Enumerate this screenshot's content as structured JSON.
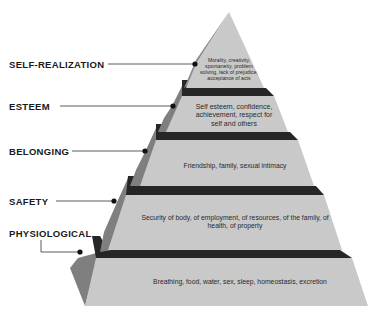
{
  "diagram": {
    "type": "pyramid",
    "title": "",
    "colors": {
      "front_face": "#c9c9c9",
      "side_face": "#7f7f7f",
      "dark_band": "#262626",
      "connector": "#333333",
      "background": "#ffffff"
    },
    "levels": [
      {
        "label": "SELF-REALIZATION",
        "description": "Morality, creativity, spontaneity, problem solving, lack of prejudice, acceptance of acts"
      },
      {
        "label": "ESTEEM",
        "description": "Self esteem, confidence, achievement, respect for self and others"
      },
      {
        "label": "BELONGING",
        "description": "Friendship, family, sexual intimacy"
      },
      {
        "label": "SAFETY",
        "description": "Security of body, of employment, of resources, of the family, of health, of property"
      },
      {
        "label": "PHYSIOLOGICAL",
        "description": "Breathing, food, water, sex, sleep, homeostasis, excretion"
      }
    ]
  }
}
